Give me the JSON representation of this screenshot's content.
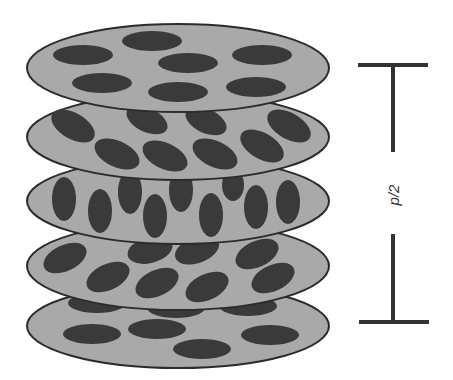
{
  "diagram": {
    "colors": {
      "disk_fill": "#a9a9a9",
      "disk_stroke": "#2b2b2b",
      "molecule": "#3a3a3a",
      "bar": "#333333"
    },
    "layers": [
      {
        "cy": 68,
        "angle": 0
      },
      {
        "cy": 137,
        "angle": 30
      },
      {
        "cy": 201,
        "angle": 90
      },
      {
        "cy": 266,
        "angle": -30
      },
      {
        "cy": 326,
        "angle": 0
      }
    ],
    "pitch_label": "p/2"
  }
}
